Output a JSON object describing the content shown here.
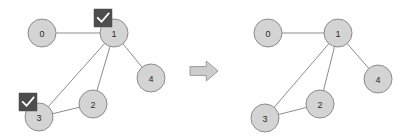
{
  "figure": {
    "background_color": "#ffffff",
    "width": 414,
    "height": 140
  },
  "style": {
    "node_fill": "#d4d4d4",
    "node_stroke": "#8c8c8c",
    "edge_stroke": "#8c8c8c",
    "label_color": "#2b2b2b",
    "badge_fill": "#4d4d4d",
    "badge_check_color": "#ffffff",
    "arrow_fill": "#cdcdcd",
    "arrow_stroke": "#9a9a9a",
    "node_radius": 14
  },
  "left_graph": {
    "name": "left-graph",
    "nodes": [
      {
        "id": "0",
        "label": "0",
        "cx": 42,
        "cy": 33,
        "r": 14,
        "selected": false
      },
      {
        "id": "1",
        "label": "1",
        "cx": 114,
        "cy": 33,
        "r": 14,
        "selected": true
      },
      {
        "id": "2",
        "label": "2",
        "cx": 93,
        "cy": 104,
        "r": 14,
        "selected": false
      },
      {
        "id": "3",
        "label": "3",
        "cx": 39,
        "cy": 117,
        "r": 14,
        "selected": true
      },
      {
        "id": "4",
        "label": "4",
        "cx": 151,
        "cy": 78,
        "r": 14,
        "selected": false
      }
    ],
    "edges": [
      {
        "source": "0",
        "target": "1"
      },
      {
        "source": "1",
        "target": "2"
      },
      {
        "source": "1",
        "target": "3"
      },
      {
        "source": "1",
        "target": "4"
      },
      {
        "source": "2",
        "target": "3"
      }
    ],
    "badges": [
      {
        "node": "1",
        "icon": "checkmark-icon",
        "x": 94,
        "y": 9,
        "size": 18
      },
      {
        "node": "3",
        "icon": "checkmark-icon",
        "x": 19,
        "y": 93,
        "size": 18
      }
    ]
  },
  "arrow": {
    "name": "transition-arrow",
    "icon": "arrow-right-icon",
    "x": 190,
    "y": 61,
    "width": 28,
    "height": 20
  },
  "right_graph": {
    "name": "right-graph",
    "nodes": [
      {
        "id": "0",
        "label": "0",
        "cx": 268,
        "cy": 33,
        "r": 14,
        "selected": false
      },
      {
        "id": "1",
        "label": "1",
        "cx": 338,
        "cy": 33,
        "r": 14,
        "selected": false
      },
      {
        "id": "2",
        "label": "2",
        "cx": 320,
        "cy": 104,
        "r": 14,
        "selected": false
      },
      {
        "id": "3",
        "label": "3",
        "cx": 265,
        "cy": 118,
        "r": 14,
        "selected": false
      },
      {
        "id": "4",
        "label": "4",
        "cx": 378,
        "cy": 79,
        "r": 14,
        "selected": false
      }
    ],
    "edges": [
      {
        "source": "0",
        "target": "1"
      },
      {
        "source": "1",
        "target": "2"
      },
      {
        "source": "1",
        "target": "3"
      },
      {
        "source": "1",
        "target": "4"
      },
      {
        "source": "2",
        "target": "3"
      }
    ],
    "badges": []
  }
}
